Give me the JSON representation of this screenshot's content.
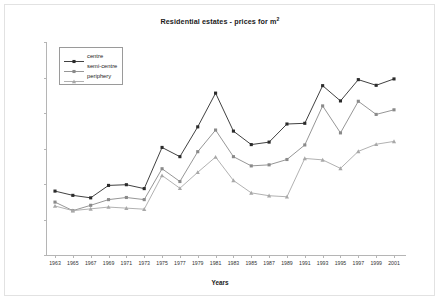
{
  "chart_data": {
    "type": "line",
    "title": "Residential estates - prices for m",
    "title_sup": "2",
    "xlabel": "Years",
    "ylabel": "Values in constant Euros",
    "ylim": [
      0,
      3000
    ],
    "ytick_values": [
      0,
      500,
      1000,
      1500,
      2000,
      2500,
      3000
    ],
    "ytick_labels": [
      "0",
      "500",
      "1000",
      "1500",
      "2000",
      "2500",
      "3000"
    ],
    "grid": false,
    "legend_position": "upper-left-inside",
    "categories": [
      1963,
      1965,
      1967,
      1969,
      1971,
      1973,
      1975,
      1977,
      1979,
      1981,
      1983,
      1985,
      1987,
      1989,
      1991,
      1993,
      1995,
      1997,
      1999,
      2001
    ],
    "xtick_labels": [
      "1963",
      "1965",
      "1967",
      "1969",
      "1971",
      "1973",
      "1975",
      "1977",
      "1979",
      "1981",
      "1983",
      "1985",
      "1987",
      "1989",
      "1991",
      "1993",
      "1995",
      "1997",
      "1999",
      "2001"
    ],
    "series": [
      {
        "name": "centre",
        "color": "#2b2b2b",
        "marker": "square",
        "values": [
          900,
          840,
          805,
          980,
          990,
          935,
          1515,
          1385,
          1805,
          2280,
          1745,
          1555,
          1590,
          1845,
          1855,
          2385,
          2170,
          2470,
          2390,
          2480
        ]
      },
      {
        "name": "semi-centre",
        "color": "#8a8a8a",
        "marker": "square",
        "values": [
          745,
          625,
          700,
          780,
          810,
          780,
          1215,
          1035,
          1455,
          1760,
          1385,
          1255,
          1270,
          1345,
          1550,
          2100,
          1720,
          2165,
          1980,
          2045
        ]
      },
      {
        "name": "periphery",
        "color": "#a8a8a8",
        "marker": "triangle",
        "values": [
          690,
          625,
          650,
          675,
          660,
          645,
          1120,
          940,
          1165,
          1380,
          1050,
          875,
          835,
          820,
          1360,
          1340,
          1220,
          1460,
          1560,
          1600
        ]
      }
    ]
  }
}
